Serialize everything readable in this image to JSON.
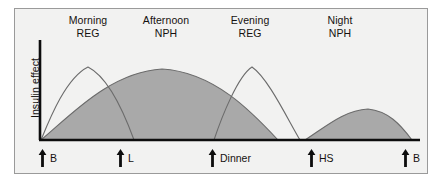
{
  "figure": {
    "background_color": "#f2f2f1",
    "border_color": "#9a9a9a",
    "axis_color": "#0d0d0d",
    "curve_line_color": "#6e6e6e",
    "fill_color": "#a9a9a9",
    "text_color": "#15110f"
  },
  "axes": {
    "y_label": "Insulin effect",
    "x_origin_px": 40,
    "x_end_px": 420,
    "y_top_px": 40,
    "y_baseline_px": 140
  },
  "column_headings": [
    {
      "name": "morning-reg",
      "line1": "Morning",
      "line2": "REG",
      "center_x": 88
    },
    {
      "name": "afternoon-nph",
      "line1": "Afternoon",
      "line2": "NPH",
      "center_x": 166
    },
    {
      "name": "evening-reg",
      "line1": "Evening",
      "line2": "REG",
      "center_x": 250
    },
    {
      "name": "night-nph",
      "line1": "Night",
      "line2": "NPH",
      "center_x": 340
    }
  ],
  "event_markers": [
    {
      "name": "breakfast-morning",
      "label": "B",
      "x": 38
    },
    {
      "name": "lunch",
      "label": "L",
      "x": 116
    },
    {
      "name": "dinner",
      "label": "Dinner",
      "x": 208
    },
    {
      "name": "bedtime",
      "label": "HS",
      "x": 307
    },
    {
      "name": "breakfast-next",
      "label": "B",
      "x": 401
    }
  ],
  "chart_data": {
    "type": "area",
    "title": "",
    "xlabel": "",
    "ylabel": "Insulin effect",
    "grid": false,
    "legend_position": "top",
    "x_axis_events": [
      "B",
      "L",
      "Dinner",
      "HS",
      "B"
    ],
    "series": [
      {
        "name": "Morning REG",
        "insulin_type": "REG",
        "filled": false,
        "path": "M 41 140 C 50 118, 66 78, 88 67 C 110 78, 126 118, 134 140",
        "peak": {
          "x": 88,
          "y": 67
        },
        "start_x": 41,
        "end_x": 134
      },
      {
        "name": "Afternoon NPH",
        "insulin_type": "NPH",
        "filled": true,
        "path": "M 41 140 C 70 116, 110 72, 162 69 C 214 72, 252 112, 278 140 Z",
        "peak": {
          "x": 162,
          "y": 69
        },
        "start_x": 41,
        "end_x": 278
      },
      {
        "name": "Evening REG",
        "insulin_type": "REG",
        "filled": false,
        "path": "M 214 140 C 222 116, 238 76, 252 67 C 268 78, 287 118, 300 140",
        "peak": {
          "x": 252,
          "y": 67
        },
        "start_x": 214,
        "end_x": 300
      },
      {
        "name": "Night NPH",
        "insulin_type": "NPH",
        "filled": true,
        "path": "M 305 140 C 324 128, 344 110, 368 109 C 388 111, 400 124, 412 140 Z",
        "peak": {
          "x": 368,
          "y": 109
        },
        "start_x": 305,
        "end_x": 412
      }
    ]
  }
}
